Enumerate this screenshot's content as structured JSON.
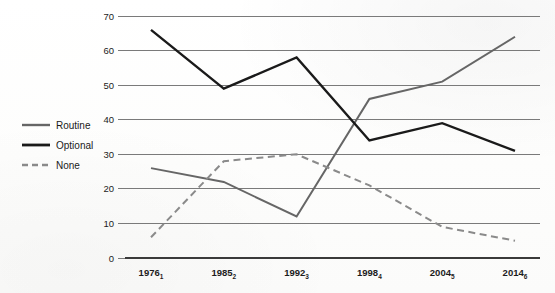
{
  "chart_data": {
    "type": "line",
    "title": "",
    "subtitle": "",
    "xlabel": "",
    "ylabel": "",
    "categories": [
      "1976",
      "1985",
      "1992",
      "1998",
      "2004",
      "2014"
    ],
    "category_subscripts": [
      "1",
      "2",
      "3",
      "4",
      "5",
      "6"
    ],
    "xtick_labels": [
      "1976₁",
      "1985₂",
      "1992₃",
      "1998₄",
      "2004₅",
      "2014₆"
    ],
    "ylim": [
      0,
      70
    ],
    "ytick_labels": [
      "0",
      "10",
      "20",
      "30",
      "40",
      "50",
      "60",
      "70"
    ],
    "ytick_values": [
      0,
      10,
      20,
      30,
      40,
      50,
      60,
      70
    ],
    "grid": true,
    "grid_axis": "y",
    "legend_position": "left-outside",
    "series": [
      {
        "name": "Routine",
        "values": [
          26,
          22,
          12,
          46,
          51,
          64
        ],
        "color": "#666666",
        "style": "solid",
        "width": 2.0
      },
      {
        "name": "Optional",
        "values": [
          66,
          49,
          58,
          34,
          39,
          31
        ],
        "color": "#1a1a1a",
        "style": "solid",
        "width": 2.4
      },
      {
        "name": "None",
        "values": [
          6,
          28,
          30,
          21,
          9,
          5
        ],
        "color": "#8a8a8a",
        "style": "dashed",
        "width": 2.0
      }
    ]
  },
  "legend": {
    "items": [
      {
        "label": "Routine",
        "swatch": "line-solid-gray-swatch"
      },
      {
        "label": "Optional",
        "swatch": "line-solid-black-swatch"
      },
      {
        "label": "None",
        "swatch": "line-dashed-gray-swatch"
      }
    ]
  },
  "colors": {
    "routine": "#666666",
    "optional": "#1a1a1a",
    "none": "#8a8a8a",
    "grid": "#7a7a7a",
    "axis": "#3a3a3a",
    "background": "#ffffff"
  }
}
